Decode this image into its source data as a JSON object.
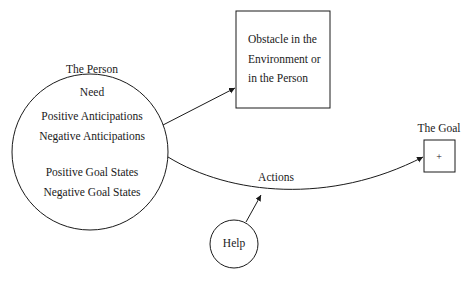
{
  "person": {
    "title": "The Person",
    "lines": [
      "Need",
      "Positive Anticipations",
      "Negative Anticipations",
      "Positive Goal States",
      "Negative Goal States"
    ]
  },
  "obstacle": {
    "lines": [
      "Obstacle in the",
      "Environment or",
      "in the Person"
    ]
  },
  "goal": {
    "title": "The Goal",
    "symbol": "+"
  },
  "actions": {
    "label": "Actions"
  },
  "help": {
    "label": "Help"
  },
  "colors": {
    "stroke": "#1a1a1a",
    "background": "#ffffff"
  }
}
